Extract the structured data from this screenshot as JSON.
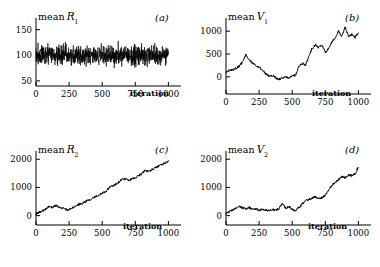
{
  "figure": {
    "background": "#ffffff",
    "line_color": "#000000",
    "axis_color": "#000000"
  },
  "panels": [
    {
      "key": "a",
      "letter": "(a)",
      "ylabel_prefix": "mean",
      "ylabel_var": "R",
      "ylabel_sub": "1",
      "xlabel": "iteration"
    },
    {
      "key": "b",
      "letter": "(b)",
      "ylabel_prefix": "mean",
      "ylabel_var": "V",
      "ylabel_sub": "1",
      "xlabel": "iteration"
    },
    {
      "key": "c",
      "letter": "(c)",
      "ylabel_prefix": "mean",
      "ylabel_var": "R",
      "ylabel_sub": "2",
      "xlabel": "iteration"
    },
    {
      "key": "d",
      "letter": "(d)",
      "ylabel_prefix": "mean",
      "ylabel_var": "V",
      "ylabel_sub": "2",
      "xlabel": "iteration"
    }
  ],
  "chart_data": [
    {
      "type": "line",
      "panel": "a",
      "title": "mean R1",
      "xlabel": "iteration",
      "ylabel": "mean R1",
      "xlim": [
        0,
        1050
      ],
      "ylim": [
        40,
        165
      ],
      "xticks": [
        0,
        250,
        500,
        750,
        1000
      ],
      "xticklabels": [
        "0",
        "250",
        "500",
        "750",
        "1000"
      ],
      "yticks": [
        50,
        100,
        150
      ],
      "yticklabels": [
        "50",
        "100",
        "150"
      ],
      "grid": false,
      "legend": "none",
      "description": "stationary white noise around 100",
      "series": [
        {
          "name": "mean R1",
          "noise": {
            "mean": 100,
            "amplitude": 28,
            "kind": "white"
          },
          "x": [
            0,
            50,
            100,
            150,
            200,
            250,
            300,
            350,
            400,
            450,
            500,
            550,
            600,
            650,
            700,
            750,
            800,
            850,
            900,
            950,
            1000
          ],
          "values": [
            101,
            99,
            102,
            104,
            98,
            100,
            97,
            103,
            101,
            99,
            100,
            102,
            101,
            98,
            100,
            99,
            103,
            100,
            101,
            99,
            102
          ]
        }
      ]
    },
    {
      "type": "line",
      "panel": "b",
      "title": "mean V1",
      "xlabel": "iteration",
      "ylabel": "mean V1",
      "xlim": [
        0,
        1050
      ],
      "ylim": [
        -200,
        1200
      ],
      "xticks": [
        0,
        250,
        500,
        750,
        1000
      ],
      "xticklabels": [
        "0",
        "250",
        "500",
        "750",
        "1000"
      ],
      "yticks": [
        0,
        500,
        1000
      ],
      "yticklabels": [
        "0",
        "500",
        "1000"
      ],
      "grid": false,
      "legend": "none",
      "description": "peak near 150 then dip below zero then strong rise after 500",
      "series": [
        {
          "name": "mean V1",
          "x": [
            0,
            25,
            50,
            75,
            100,
            125,
            150,
            175,
            200,
            225,
            250,
            275,
            300,
            325,
            350,
            375,
            400,
            425,
            450,
            475,
            500,
            525,
            550,
            575,
            600,
            625,
            650,
            675,
            700,
            725,
            750,
            775,
            800,
            825,
            850,
            875,
            900,
            925,
            950,
            975,
            1000
          ],
          "values": [
            110,
            140,
            150,
            190,
            230,
            330,
            480,
            380,
            300,
            250,
            210,
            150,
            60,
            20,
            30,
            -20,
            -60,
            -20,
            10,
            -30,
            20,
            30,
            230,
            300,
            250,
            430,
            620,
            700,
            640,
            700,
            530,
            620,
            760,
            860,
            1000,
            880,
            1090,
            880,
            930,
            860,
            970
          ]
        }
      ]
    },
    {
      "type": "line",
      "panel": "c",
      "title": "mean R2",
      "xlabel": "iteration",
      "ylabel": "mean R2",
      "xlim": [
        0,
        1050
      ],
      "ylim": [
        -120,
        2150
      ],
      "xticks": [
        0,
        250,
        500,
        750,
        1000
      ],
      "xticklabels": [
        "0",
        "250",
        "500",
        "750",
        "1000"
      ],
      "yticks": [
        0,
        1000,
        2000
      ],
      "yticklabels": [
        "0",
        "1000",
        "2000"
      ],
      "grid": false,
      "legend": "none",
      "description": "near linear upward drift from 50 to about 1900",
      "series": [
        {
          "name": "mean R2",
          "x": [
            0,
            25,
            50,
            75,
            100,
            125,
            150,
            175,
            200,
            225,
            250,
            275,
            300,
            325,
            350,
            375,
            400,
            425,
            450,
            475,
            500,
            525,
            550,
            575,
            600,
            625,
            650,
            675,
            700,
            725,
            750,
            775,
            800,
            825,
            850,
            875,
            900,
            925,
            950,
            975,
            1000
          ],
          "values": [
            60,
            110,
            160,
            230,
            330,
            290,
            360,
            300,
            260,
            220,
            200,
            280,
            330,
            400,
            440,
            500,
            560,
            600,
            680,
            720,
            790,
            840,
            980,
            1060,
            1100,
            1190,
            1280,
            1310,
            1250,
            1300,
            1350,
            1420,
            1480,
            1620,
            1560,
            1630,
            1700,
            1760,
            1820,
            1860,
            1930
          ]
        }
      ]
    },
    {
      "type": "line",
      "panel": "d",
      "title": "mean V2",
      "xlabel": "iteration",
      "ylabel": "mean V2",
      "xlim": [
        0,
        1050
      ],
      "ylim": [
        -120,
        2150
      ],
      "xticks": [
        0,
        250,
        500,
        750,
        1000
      ],
      "xticklabels": [
        "0",
        "250",
        "500",
        "750",
        "1000"
      ],
      "yticks": [
        0,
        1000,
        2000
      ],
      "yticklabels": [
        "0",
        "1000",
        "2000"
      ],
      "grid": false,
      "legend": "none",
      "description": "flat noisy near 200 until about 550 then rise to about 1700",
      "series": [
        {
          "name": "mean V2",
          "x": [
            0,
            25,
            50,
            75,
            100,
            125,
            150,
            175,
            200,
            225,
            250,
            275,
            300,
            325,
            350,
            375,
            400,
            425,
            450,
            475,
            500,
            525,
            550,
            575,
            600,
            625,
            650,
            675,
            700,
            725,
            750,
            775,
            800,
            825,
            850,
            875,
            900,
            925,
            950,
            975,
            1000
          ],
          "values": [
            80,
            150,
            200,
            250,
            320,
            280,
            240,
            290,
            220,
            250,
            180,
            230,
            200,
            160,
            230,
            190,
            250,
            430,
            260,
            330,
            210,
            180,
            280,
            400,
            520,
            560,
            620,
            680,
            600,
            640,
            720,
            900,
            1080,
            1180,
            1280,
            1380,
            1340,
            1440,
            1420,
            1480,
            1720
          ]
        }
      ]
    }
  ]
}
